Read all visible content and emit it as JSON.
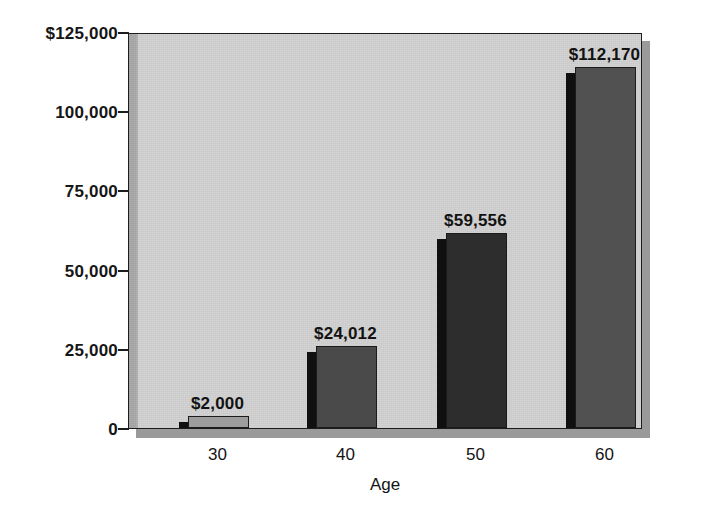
{
  "chart_data": {
    "type": "bar",
    "title": "",
    "xlabel": "Age",
    "ylabel": "",
    "categories": [
      "30",
      "40",
      "50",
      "60"
    ],
    "values": [
      2000,
      24012,
      59556,
      112170
    ],
    "value_labels": [
      "$2,000",
      "$24,012",
      "$59,556",
      "$112,170"
    ],
    "ylim": [
      0,
      125000
    ],
    "yticks": [
      0,
      25000,
      50000,
      75000,
      100000,
      125000
    ],
    "ytick_labels": [
      "0",
      "25,000",
      "50,000",
      "75,000",
      "100,000",
      "$125,000"
    ],
    "grid": false,
    "legend": false,
    "bar_colors": [
      "#9d9d9d",
      "#4a4a4a",
      "#2d2d2d",
      "#515151"
    ],
    "bar_side_color": "#101010",
    "plot_background": "#d2d2d2",
    "axis_color": "#1d1d1d",
    "page_background": "#ffffff"
  },
  "axes": {
    "y": {
      "ticks": [
        {
          "label": "$125,000",
          "value": 125000
        },
        {
          "label": "100,000",
          "value": 100000
        },
        {
          "label": "75,000",
          "value": 75000
        },
        {
          "label": "50,000",
          "value": 50000
        },
        {
          "label": "25,000",
          "value": 25000
        },
        {
          "label": "0",
          "value": 0
        }
      ]
    },
    "x": {
      "title": "Age",
      "ticks": [
        {
          "label": "30"
        },
        {
          "label": "40"
        },
        {
          "label": "50"
        },
        {
          "label": "60"
        }
      ]
    }
  },
  "bars": [
    {
      "category": "30",
      "value": 2000,
      "label": "$2,000",
      "color": "#9d9d9d"
    },
    {
      "category": "40",
      "value": 24012,
      "label": "$24,012",
      "color": "#4a4a4a"
    },
    {
      "category": "50",
      "value": 59556,
      "label": "$59,556",
      "color": "#2d2d2d"
    },
    {
      "category": "60",
      "value": 112170,
      "label": "$112,170",
      "color": "#515151"
    }
  ]
}
